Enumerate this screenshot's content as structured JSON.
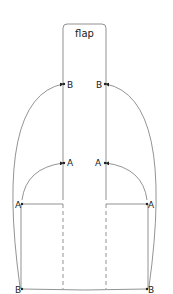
{
  "diagram": {
    "title": "flap",
    "labels": {
      "upper_left_b": "B",
      "upper_right_b": "B",
      "upper_left_a": "A",
      "upper_right_a": "A",
      "lower_left_a": "A",
      "lower_right_a": "A",
      "lower_left_b": "B",
      "lower_right_b": "B"
    },
    "colors": {
      "line": "#777777",
      "text": "#222222",
      "background": "#ffffff"
    }
  }
}
